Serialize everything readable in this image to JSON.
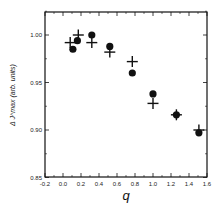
{
  "chart_data": {
    "type": "scatter",
    "title": "",
    "xlabel": "q",
    "ylabel": "Δ J^max (arb. units)",
    "xlim": [
      -0.2,
      1.6
    ],
    "ylim": [
      0.85,
      1.024
    ],
    "grid": false,
    "legend": null,
    "x_ticks": [
      "-0.2",
      "0.0",
      "0.2",
      "0.4",
      "0.6",
      "0.8",
      "1.0",
      "1.2",
      "1.4",
      "1.6"
    ],
    "y_ticks": [
      "0.85",
      "0.90",
      "0.95",
      "1.00"
    ],
    "series": [
      {
        "name": "circles",
        "marker": "filled-circle",
        "x": [
          0.11,
          0.16,
          0.32,
          0.52,
          0.77,
          1.0,
          1.26,
          1.51
        ],
        "y": [
          0.985,
          0.994,
          1.0,
          0.988,
          0.96,
          0.938,
          0.916,
          0.897
        ]
      },
      {
        "name": "crosses",
        "marker": "plus",
        "x": [
          0.08,
          0.17,
          0.32,
          0.52,
          0.77,
          1.0,
          1.26,
          1.51
        ],
        "y": [
          0.992,
          1.0,
          0.992,
          0.982,
          0.972,
          0.928,
          0.916,
          0.9
        ]
      }
    ]
  }
}
